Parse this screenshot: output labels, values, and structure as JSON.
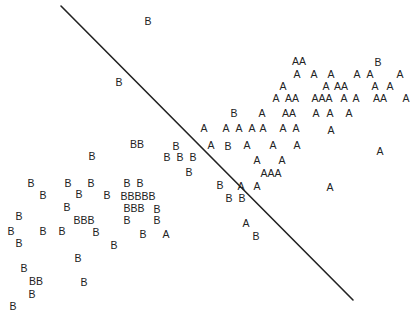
{
  "chart_data": {
    "type": "scatter",
    "title": "",
    "xlabel": "",
    "ylabel": "",
    "grid": false,
    "legend": [],
    "axes_visible": false,
    "classes": [
      "A",
      "B"
    ],
    "decision_boundary": {
      "x1": 61,
      "y1": 6,
      "x2": 353,
      "y2": 300
    },
    "points": [
      {
        "label": "B",
        "x": 148,
        "y": 21
      },
      {
        "label": "B",
        "x": 119,
        "y": 82
      },
      {
        "label": "AA",
        "x": 299,
        "y": 61
      },
      {
        "label": "B",
        "x": 378,
        "y": 62
      },
      {
        "label": "A",
        "x": 297,
        "y": 74
      },
      {
        "label": "A",
        "x": 314,
        "y": 74
      },
      {
        "label": "A",
        "x": 331,
        "y": 74
      },
      {
        "label": "A",
        "x": 357,
        "y": 74
      },
      {
        "label": "A",
        "x": 370,
        "y": 74
      },
      {
        "label": "A",
        "x": 400,
        "y": 74
      },
      {
        "label": "A",
        "x": 283,
        "y": 86
      },
      {
        "label": "A",
        "x": 326,
        "y": 86
      },
      {
        "label": "AA",
        "x": 341,
        "y": 86
      },
      {
        "label": "A",
        "x": 375,
        "y": 86
      },
      {
        "label": "A",
        "x": 390,
        "y": 86
      },
      {
        "label": "A",
        "x": 276,
        "y": 98
      },
      {
        "label": "AA",
        "x": 292,
        "y": 98
      },
      {
        "label": "AAA",
        "x": 322,
        "y": 98
      },
      {
        "label": "A",
        "x": 344,
        "y": 98
      },
      {
        "label": "A",
        "x": 356,
        "y": 98
      },
      {
        "label": "AA",
        "x": 380,
        "y": 98
      },
      {
        "label": "A",
        "x": 406,
        "y": 98
      },
      {
        "label": "B",
        "x": 234,
        "y": 113
      },
      {
        "label": "A",
        "x": 262,
        "y": 113
      },
      {
        "label": "AA",
        "x": 289,
        "y": 113
      },
      {
        "label": "A",
        "x": 316,
        "y": 113
      },
      {
        "label": "A",
        "x": 330,
        "y": 113
      },
      {
        "label": "A",
        "x": 349,
        "y": 113
      },
      {
        "label": "A",
        "x": 204,
        "y": 128
      },
      {
        "label": "A",
        "x": 226,
        "y": 128
      },
      {
        "label": "A",
        "x": 239,
        "y": 128
      },
      {
        "label": "A",
        "x": 252,
        "y": 128
      },
      {
        "label": "A",
        "x": 263,
        "y": 128
      },
      {
        "label": "A",
        "x": 283,
        "y": 128
      },
      {
        "label": "A",
        "x": 296,
        "y": 128
      },
      {
        "label": "A",
        "x": 331,
        "y": 130
      },
      {
        "label": "BB",
        "x": 137,
        "y": 144
      },
      {
        "label": "B",
        "x": 176,
        "y": 146
      },
      {
        "label": "A",
        "x": 211,
        "y": 145
      },
      {
        "label": "B",
        "x": 228,
        "y": 146
      },
      {
        "label": "A",
        "x": 247,
        "y": 145
      },
      {
        "label": "A",
        "x": 273,
        "y": 145
      },
      {
        "label": "A",
        "x": 297,
        "y": 145
      },
      {
        "label": "A",
        "x": 380,
        "y": 151
      },
      {
        "label": "B",
        "x": 92,
        "y": 156
      },
      {
        "label": "B",
        "x": 167,
        "y": 157
      },
      {
        "label": "B",
        "x": 180,
        "y": 157
      },
      {
        "label": "B",
        "x": 193,
        "y": 157
      },
      {
        "label": "A",
        "x": 257,
        "y": 160
      },
      {
        "label": "A",
        "x": 282,
        "y": 160
      },
      {
        "label": "B",
        "x": 189,
        "y": 172
      },
      {
        "label": "AAA",
        "x": 271,
        "y": 173
      },
      {
        "label": "B",
        "x": 31,
        "y": 183
      },
      {
        "label": "B",
        "x": 68,
        "y": 183
      },
      {
        "label": "B",
        "x": 91,
        "y": 183
      },
      {
        "label": "B",
        "x": 127,
        "y": 183
      },
      {
        "label": "B",
        "x": 140,
        "y": 183
      },
      {
        "label": "B",
        "x": 220,
        "y": 185
      },
      {
        "label": "A",
        "x": 241,
        "y": 186
      },
      {
        "label": "A",
        "x": 257,
        "y": 186
      },
      {
        "label": "A",
        "x": 330,
        "y": 187
      },
      {
        "label": "B",
        "x": 43,
        "y": 195
      },
      {
        "label": "B",
        "x": 79,
        "y": 194
      },
      {
        "label": "B",
        "x": 107,
        "y": 195
      },
      {
        "label": "BBBBB",
        "x": 138,
        "y": 196
      },
      {
        "label": "B",
        "x": 229,
        "y": 198
      },
      {
        "label": "B",
        "x": 242,
        "y": 198
      },
      {
        "label": "B",
        "x": 67,
        "y": 207
      },
      {
        "label": "BBB",
        "x": 134,
        "y": 208
      },
      {
        "label": "B",
        "x": 157,
        "y": 209
      },
      {
        "label": "B",
        "x": 19,
        "y": 216
      },
      {
        "label": "BBB",
        "x": 84,
        "y": 220
      },
      {
        "label": "B",
        "x": 127,
        "y": 220
      },
      {
        "label": "B",
        "x": 157,
        "y": 220
      },
      {
        "label": "A",
        "x": 246,
        "y": 223
      },
      {
        "label": "B",
        "x": 11,
        "y": 231
      },
      {
        "label": "B",
        "x": 43,
        "y": 231
      },
      {
        "label": "B",
        "x": 62,
        "y": 231
      },
      {
        "label": "B",
        "x": 96,
        "y": 232
      },
      {
        "label": "B",
        "x": 143,
        "y": 234
      },
      {
        "label": "A",
        "x": 166,
        "y": 234
      },
      {
        "label": "B",
        "x": 256,
        "y": 236
      },
      {
        "label": "B",
        "x": 19,
        "y": 243
      },
      {
        "label": "B",
        "x": 114,
        "y": 245
      },
      {
        "label": "B",
        "x": 78,
        "y": 258
      },
      {
        "label": "B",
        "x": 24,
        "y": 268
      },
      {
        "label": "BB",
        "x": 36,
        "y": 281
      },
      {
        "label": "B",
        "x": 84,
        "y": 282
      },
      {
        "label": "B",
        "x": 32,
        "y": 294
      },
      {
        "label": "B",
        "x": 13,
        "y": 306
      }
    ]
  },
  "colors": {
    "ink": "#222222",
    "background": "#ffffff"
  }
}
